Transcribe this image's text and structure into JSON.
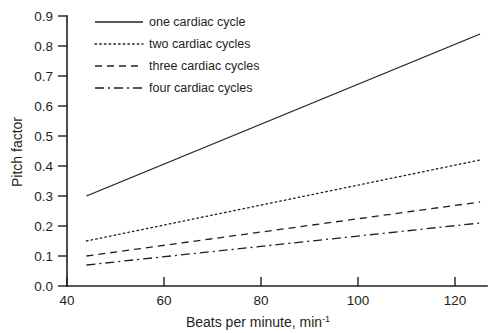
{
  "chart_data": {
    "type": "line",
    "title": "",
    "xlabel": "Beats per minute, min",
    "xlabel_sup": "-1",
    "ylabel": "Pitch factor",
    "xlim": [
      40,
      126
    ],
    "ylim": [
      0.0,
      0.9
    ],
    "grid": false,
    "legend_position": "top-left-inside",
    "x_ticks": [
      40,
      60,
      80,
      100,
      120
    ],
    "x_tick_labels": [
      "40",
      "60",
      "80",
      "100",
      "120"
    ],
    "y_ticks": [
      0.0,
      0.1,
      0.2,
      0.3,
      0.4,
      0.5,
      0.6,
      0.7,
      0.8,
      0.9
    ],
    "y_tick_labels": [
      "0.0",
      "0.1",
      "0.2",
      "0.3",
      "0.4",
      "0.5",
      "0.6",
      "0.7",
      "0.8",
      "0.9"
    ],
    "x": [
      44,
      125
    ],
    "series": [
      {
        "name": "one cardiac cycle",
        "dash": "solid",
        "values": [
          0.3,
          0.84
        ]
      },
      {
        "name": "two cardiac cycles",
        "dash": "dotted",
        "values": [
          0.15,
          0.42
        ]
      },
      {
        "name": "three cardiac cycles",
        "dash": "dashed",
        "values": [
          0.1,
          0.28
        ]
      },
      {
        "name": "four cardiac cycles",
        "dash": "dashdot",
        "values": [
          0.07,
          0.21
        ]
      }
    ]
  },
  "colors": {
    "ink": "#231f20",
    "background": "#ffffff"
  },
  "legend": {
    "items": [
      {
        "label": "one cardiac cycle"
      },
      {
        "label": "two cardiac cycles"
      },
      {
        "label": "three cardiac cycles"
      },
      {
        "label": "four cardiac cycles"
      }
    ]
  }
}
